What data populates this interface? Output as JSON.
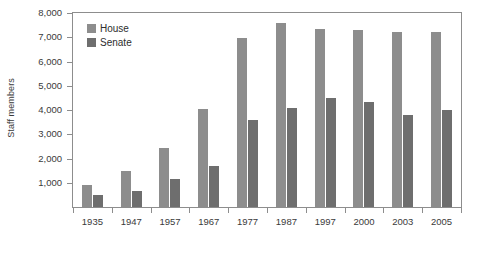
{
  "chart_data": {
    "type": "bar",
    "title": "",
    "subtitle": "",
    "xlabel": "",
    "ylabel": "Staff members",
    "categories": [
      "1935",
      "1947",
      "1957",
      "1967",
      "1977",
      "1987",
      "1997",
      "2000",
      "2003",
      "2005"
    ],
    "series": [
      {
        "name": "House",
        "color": "#8d8d8d",
        "values": [
          900,
          1500,
          2450,
          4050,
          6950,
          7600,
          7350,
          7300,
          7200,
          7200
        ]
      },
      {
        "name": "Senate",
        "color": "#6e6e6e",
        "values": [
          500,
          650,
          1150,
          1700,
          3600,
          4100,
          4500,
          4350,
          3800,
          4000
        ]
      }
    ],
    "ylim": [
      0,
      8000
    ],
    "ytick_values": [
      1000,
      2000,
      3000,
      4000,
      5000,
      6000,
      7000,
      8000
    ],
    "ytick_labels": [
      "1,000",
      "2,000",
      "3,000",
      "4,000",
      "5,000",
      "6,000",
      "7,000",
      "8,000"
    ],
    "grid": false,
    "legend_position": "top-left",
    "legend_entries": [
      "House",
      "Senate"
    ]
  }
}
